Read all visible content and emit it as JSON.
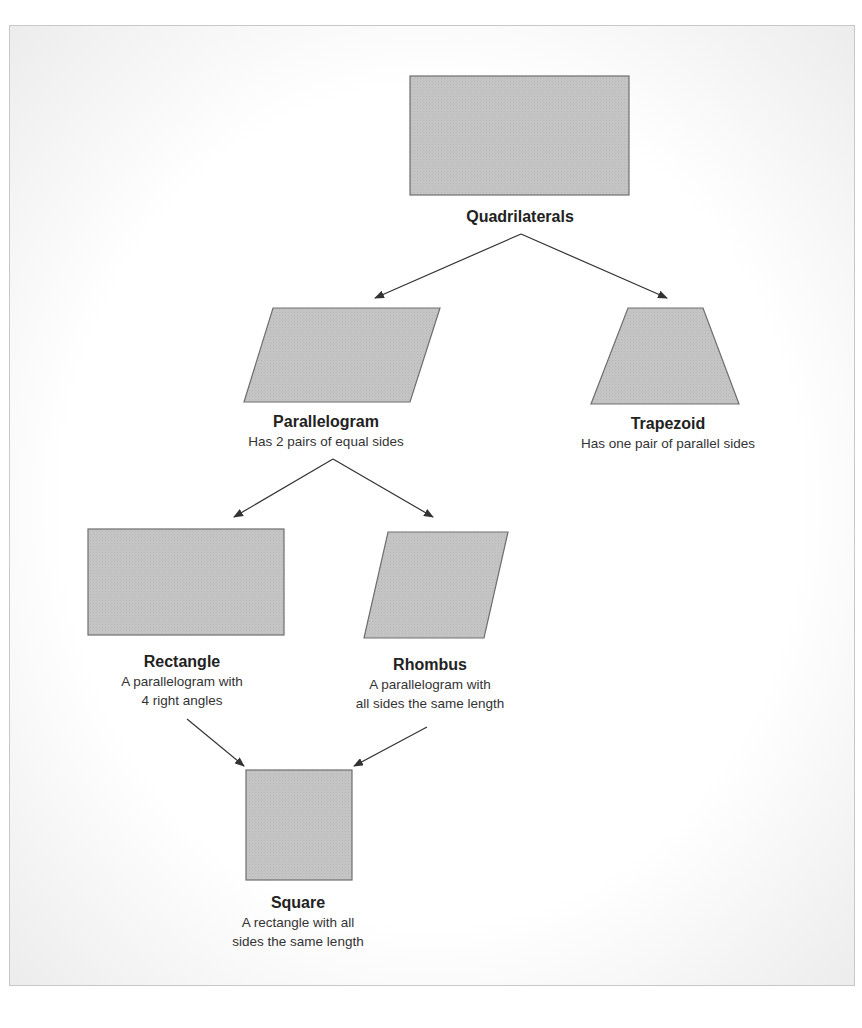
{
  "diagram": {
    "colors": {
      "shape_fill": "#c4c4c4",
      "shape_stroke": "#6e6e6e",
      "arrow": "#333333",
      "text": "#222222"
    },
    "nodes": {
      "quadrilaterals": {
        "title": "Quadrilaterals",
        "shape": "rectangle"
      },
      "parallelogram": {
        "title": "Parallelogram",
        "desc": [
          "Has 2 pairs of equal sides"
        ],
        "shape": "parallelogram"
      },
      "trapezoid": {
        "title": "Trapezoid",
        "desc": [
          "Has one pair of parallel sides"
        ],
        "shape": "trapezoid"
      },
      "rectangle": {
        "title": "Rectangle",
        "desc": [
          "A parallelogram with",
          "4 right angles"
        ],
        "shape": "rectangle"
      },
      "rhombus": {
        "title": "Rhombus",
        "desc": [
          "A parallelogram with",
          "all sides the same length"
        ],
        "shape": "rhombus"
      },
      "square": {
        "title": "Square",
        "desc": [
          "A rectangle with all",
          "sides the same length"
        ],
        "shape": "square"
      }
    },
    "edges": [
      {
        "from": "quadrilaterals",
        "to": "parallelogram"
      },
      {
        "from": "quadrilaterals",
        "to": "trapezoid"
      },
      {
        "from": "parallelogram",
        "to": "rectangle"
      },
      {
        "from": "parallelogram",
        "to": "rhombus"
      },
      {
        "from": "rectangle",
        "to": "square"
      },
      {
        "from": "rhombus",
        "to": "square"
      }
    ]
  }
}
